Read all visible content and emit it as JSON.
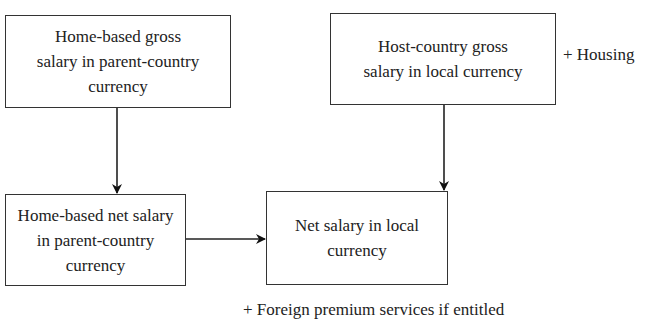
{
  "diagram": {
    "boxes": {
      "home_gross": {
        "lines": [
          "Home-based gross",
          "salary in parent-country",
          "currency"
        ]
      },
      "host_gross": {
        "lines": [
          "Host-country gross",
          "salary in local currency"
        ]
      },
      "home_net": {
        "lines": [
          "Home-based net salary",
          "in parent-country",
          "currency"
        ]
      },
      "net_local": {
        "lines": [
          "Net salary in local",
          "currency"
        ]
      }
    },
    "annotations": {
      "housing": "+ Housing",
      "bottom_note": "+ Foreign premium services if entitled"
    },
    "arrows": [
      {
        "from": "home_gross",
        "to": "home_net"
      },
      {
        "from": "host_gross",
        "to": "net_local"
      },
      {
        "from": "home_net",
        "to": "net_local"
      }
    ],
    "colors": {
      "stroke": "#222222",
      "text": "#222222",
      "background": "#ffffff"
    }
  }
}
